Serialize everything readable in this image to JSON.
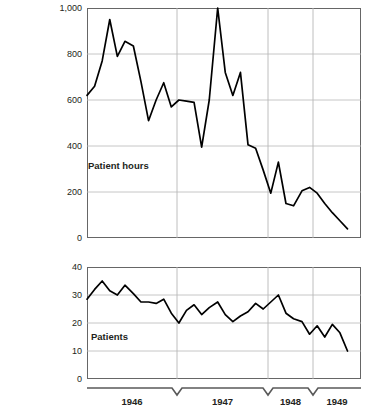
{
  "chart_data": [
    {
      "type": "line",
      "id": "patient-hours",
      "title": "",
      "series_label": "Patient hours",
      "xlabel": "",
      "ylabel": "",
      "ylim": [
        0,
        1000
      ],
      "yticks": [
        0,
        200,
        400,
        600,
        800,
        1000
      ],
      "ytick_labels": [
        "0",
        "200",
        "400",
        "600",
        "800",
        "1,000"
      ],
      "grid": true,
      "grid_axis": "both",
      "xlim": [
        1946.0,
        1949.25
      ],
      "xticks": [
        1946,
        1947,
        1948,
        1949
      ],
      "xtick_labels": [
        "1946",
        "1947",
        "1948",
        "1949"
      ],
      "line_color": "#000000",
      "x": [
        1946.0,
        1946.09,
        1946.18,
        1946.27,
        1946.36,
        1946.45,
        1946.55,
        1946.64,
        1946.73,
        1946.82,
        1946.91,
        1947.0,
        1947.09,
        1947.18,
        1947.27,
        1947.36,
        1947.45,
        1947.55,
        1947.64,
        1947.73,
        1947.82,
        1947.91,
        1948.0,
        1948.09,
        1948.18,
        1948.27,
        1948.36,
        1948.45,
        1948.55,
        1948.64,
        1948.73,
        1948.82,
        1948.91,
        1949.0,
        1949.09
      ],
      "values": [
        620,
        660,
        770,
        950,
        790,
        855,
        835,
        680,
        510,
        600,
        675,
        570,
        600,
        595,
        590,
        395,
        600,
        1000,
        720,
        620,
        720,
        405,
        390,
        295,
        195,
        330,
        150,
        140,
        205,
        220,
        195,
        150,
        110,
        75,
        40
      ]
    },
    {
      "type": "line",
      "id": "patients",
      "title": "",
      "series_label": "Patients",
      "xlabel": "",
      "ylabel": "",
      "ylim": [
        0,
        40
      ],
      "yticks": [
        0,
        10,
        20,
        30,
        40
      ],
      "ytick_labels": [
        "0",
        "10",
        "20",
        "30",
        "40"
      ],
      "grid": true,
      "grid_axis": "both",
      "xlim": [
        1946.0,
        1949.25
      ],
      "xticks": [
        1946,
        1947,
        1948,
        1949
      ],
      "xtick_labels": [
        "1946",
        "1947",
        "1948",
        "1949"
      ],
      "line_color": "#000000",
      "x": [
        1946.0,
        1946.09,
        1946.18,
        1946.27,
        1946.36,
        1946.45,
        1946.55,
        1946.64,
        1946.73,
        1946.82,
        1946.91,
        1947.0,
        1947.09,
        1947.18,
        1947.27,
        1947.36,
        1947.45,
        1947.55,
        1947.64,
        1947.73,
        1947.82,
        1947.91,
        1948.0,
        1948.09,
        1948.18,
        1948.27,
        1948.36,
        1948.45,
        1948.55,
        1948.64,
        1948.73,
        1948.82,
        1948.91,
        1949.0,
        1949.09
      ],
      "values": [
        28.5,
        32.0,
        35.0,
        31.5,
        30.0,
        33.5,
        30.5,
        27.5,
        27.5,
        27.0,
        28.5,
        23.5,
        20.0,
        24.5,
        26.5,
        23.0,
        25.5,
        27.5,
        23.0,
        20.5,
        22.5,
        24.0,
        27.0,
        25.0,
        27.5,
        30.0,
        23.5,
        21.5,
        20.5,
        16.0,
        19.0,
        15.0,
        19.5,
        16.5,
        10.0
      ]
    }
  ],
  "panels": {
    "hours": {
      "series_label": "Patient hours",
      "ytick_labels": [
        "1,000",
        "800",
        "600",
        "400",
        "200",
        "0"
      ]
    },
    "patients": {
      "series_label": "Patients",
      "ytick_labels": [
        "40",
        "30",
        "20",
        "10",
        "0"
      ]
    }
  },
  "xaxis": {
    "tick_labels": [
      "1946",
      "1947",
      "1948",
      "1949"
    ]
  }
}
